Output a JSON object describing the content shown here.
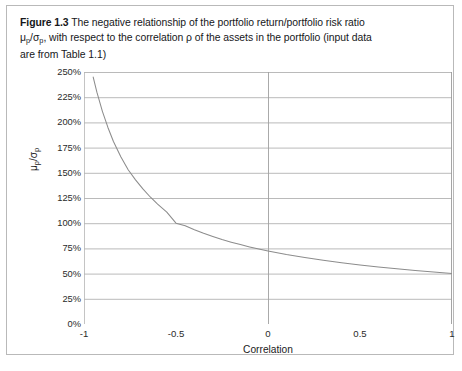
{
  "figure": {
    "label": "Figure 1.3",
    "caption_line1": "The negative relationship of the portfolio return/portfolio risk ratio",
    "caption_mu": "μ",
    "caption_sub_p1": "p",
    "caption_slash": "/σ",
    "caption_sub_p2": "p",
    "caption_line2": ", with respect to the correlation ρ of the assets in the portfolio (input data",
    "caption_line3": "are from Table 1.1)"
  },
  "axes": {
    "y_title_mu": "μ",
    "y_title_sub1": "p",
    "y_title_slash": "/σ",
    "y_title_sub2": "p",
    "x_title": "Correlation"
  },
  "chart_data": {
    "type": "line",
    "xlabel": "Correlation",
    "ylabel": "μ_p/σ_p",
    "xlim": [
      -1,
      1
    ],
    "ylim": [
      0,
      2.5
    ],
    "grid": "horizontal",
    "legend": "none",
    "line_color": "#8c8c8c",
    "x_ticks": [
      -1,
      -0.5,
      0,
      0.5,
      1
    ],
    "x_tick_labels": [
      "-1",
      "-0.5",
      "0",
      "0.5",
      "1"
    ],
    "y_ticks": [
      0,
      0.25,
      0.5,
      0.75,
      1.0,
      1.25,
      1.5,
      1.75,
      2.0,
      2.25,
      2.5
    ],
    "y_tick_labels": [
      "0%",
      "25%",
      "50%",
      "75%",
      "100%",
      "125%",
      "150%",
      "175%",
      "200%",
      "225%",
      "250%"
    ],
    "series": [
      {
        "name": "mu_p/sigma_p",
        "x": [
          -0.95,
          -0.93,
          -0.9,
          -0.87,
          -0.84,
          -0.8,
          -0.76,
          -0.72,
          -0.68,
          -0.64,
          -0.6,
          -0.55,
          -0.5,
          -0.45,
          -0.4,
          -0.35,
          -0.3,
          -0.25,
          -0.2,
          -0.15,
          -0.1,
          -0.05,
          0.0,
          0.1,
          0.2,
          0.3,
          0.4,
          0.5,
          0.6,
          0.7,
          0.8,
          0.9,
          1.0
        ],
        "y": [
          2.45,
          2.3,
          2.11,
          1.95,
          1.81,
          1.66,
          1.53,
          1.43,
          1.34,
          1.26,
          1.19,
          1.11,
          1.0,
          0.975,
          0.935,
          0.9,
          0.868,
          0.838,
          0.812,
          0.788,
          0.765,
          0.744,
          0.725,
          0.69,
          0.66,
          0.632,
          0.608,
          0.586,
          0.566,
          0.548,
          0.531,
          0.515,
          0.5
        ]
      }
    ]
  }
}
